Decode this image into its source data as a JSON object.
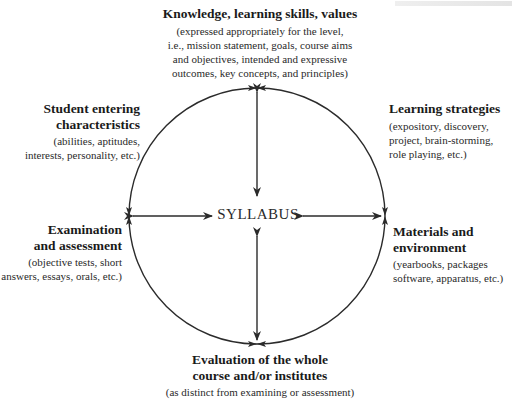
{
  "diagram": {
    "center": {
      "label": "SYLLABUS"
    },
    "nodes": {
      "top": {
        "title": "Knowledge, learning skills, values",
        "detail": [
          "(expressed appropriately for the level,",
          "i.e., mission statement, goals, course aims",
          "and objectives, intended and expressive",
          "outcomes, key concepts, and principles)"
        ]
      },
      "upper_left": {
        "title": [
          "Student entering",
          "characteristics"
        ],
        "detail": [
          "(abilities, aptitudes,",
          "interests, personality, etc.)"
        ]
      },
      "upper_right": {
        "title": "Learning strategies",
        "detail": [
          "(expository, discovery,",
          "project, brain-storming,",
          "role playing, etc.)"
        ]
      },
      "lower_left": {
        "title": [
          "Examination",
          "and assessment"
        ],
        "detail": [
          "(objective tests, short",
          "answers, essays, orals, etc.)"
        ]
      },
      "lower_right": {
        "title": [
          "Materials and",
          "environment"
        ],
        "detail": [
          "(yearbooks, packages",
          "software, apparatus, etc.)"
        ]
      },
      "bottom": {
        "title": [
          "Evaluation of the whole",
          "course and/or institutes"
        ],
        "detail": [
          "(as distinct from examining or assessment)"
        ]
      }
    },
    "colors": {
      "line": "#2b2b2b",
      "text": "#1e1e1e"
    }
  }
}
